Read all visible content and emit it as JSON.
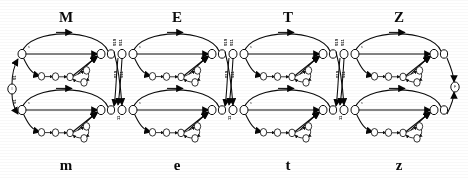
{
  "figure": {
    "kind": "state-transition-network",
    "rows": [
      {
        "id": "upper",
        "label": "upper-case-row"
      },
      {
        "id": "lower",
        "label": "lower-case-row"
      }
    ]
  },
  "modules": [
    {
      "upper_label": "M",
      "lower_label": "m"
    },
    {
      "upper_label": "E",
      "lower_label": "e"
    },
    {
      "upper_label": "T",
      "lower_label": "t"
    },
    {
      "upper_label": "Z",
      "lower_label": "z"
    }
  ],
  "junction_labels": {
    "upper_left": "010",
    "upper_right": "011",
    "lower": "11",
    "start": "01"
  },
  "edge_labels": {
    "skip": "s",
    "loop": "1",
    "exit": "e"
  },
  "terminals": {
    "start": "I",
    "end": "F"
  },
  "node_ids": {
    "entry": "0",
    "mid": "1",
    "exit": "2",
    "chain": [
      "1",
      "0",
      "0",
      "1",
      "0"
    ]
  },
  "colors": {
    "ink": "#101010",
    "paper": "#ffffff",
    "node_fill": "#fdfdfd"
  }
}
